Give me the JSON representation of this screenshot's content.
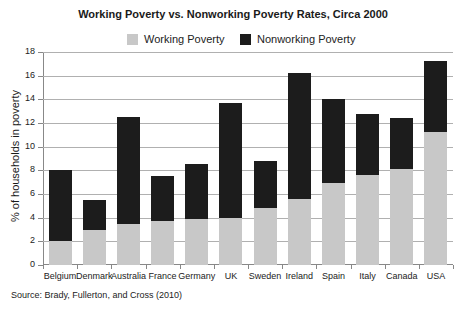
{
  "chart_data": {
    "type": "bar",
    "stacked": true,
    "title": "Working Poverty vs. Nonworking Poverty Rates, Circa 2000",
    "xlabel": "",
    "ylabel": "% of households in poverty",
    "ylim": [
      0,
      18
    ],
    "yticks": [
      0,
      2,
      4,
      6,
      8,
      10,
      12,
      14,
      16,
      18
    ],
    "grid": true,
    "legend_position": "top",
    "categories": [
      "Belgium",
      "Denmark",
      "Australia",
      "France",
      "Germany",
      "UK",
      "Sweden",
      "Ireland",
      "Spain",
      "Italy",
      "Canada",
      "USA"
    ],
    "series": [
      {
        "name": "Working Poverty",
        "color": "#c8c8c8",
        "values": [
          2.0,
          3.0,
          3.5,
          3.7,
          3.9,
          4.0,
          4.8,
          5.6,
          6.9,
          7.6,
          8.1,
          11.2
        ]
      },
      {
        "name": "Nonworking Poverty",
        "color": "#1c1c1c",
        "values": [
          6.0,
          2.5,
          9.0,
          3.8,
          4.6,
          9.7,
          4.0,
          10.6,
          7.1,
          5.2,
          4.3,
          6.0
        ]
      }
    ],
    "totals": [
      8.0,
      5.5,
      12.5,
      7.5,
      8.5,
      13.7,
      8.8,
      16.2,
      14.0,
      12.8,
      12.4,
      17.2
    ],
    "source": "Source: Brady, Fullerton, and Cross (2010)"
  },
  "title": "Working Poverty vs. Nonworking Poverty Rates, Circa 2000",
  "legend": [
    {
      "label": "Working Poverty",
      "color": "#c8c8c8"
    },
    {
      "label": "Nonworking Poverty",
      "color": "#1c1c1c"
    }
  ],
  "ylabel": "% of households in poverty",
  "source": "Source: Brady, Fullerton, and Cross (2010)"
}
